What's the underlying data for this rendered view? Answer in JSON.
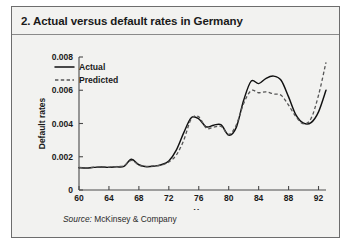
{
  "panel": {
    "title": "2. Actual versus default rates in Germany",
    "source_label": "Source:",
    "source_text": "McKinsey & Company"
  },
  "chart_data": {
    "type": "line",
    "title": "2. Actual versus default rates in Germany",
    "xlabel": "Year",
    "ylabel": "Default rates",
    "xlim": [
      60,
      93
    ],
    "ylim": [
      0,
      0.008
    ],
    "xticks": [
      60,
      64,
      68,
      72,
      76,
      80,
      84,
      88,
      92
    ],
    "yticks": [
      0,
      0.002,
      0.004,
      0.006,
      0.008
    ],
    "ytick_labels": [
      "0",
      "0.002",
      "0.004",
      "0.006",
      "0.008"
    ],
    "grid": false,
    "legend_position": "top-left",
    "legend": [
      "Actual",
      "Predicted"
    ],
    "x": [
      60,
      61,
      62,
      63,
      64,
      65,
      66,
      67,
      68,
      69,
      70,
      71,
      72,
      73,
      74,
      75,
      76,
      77,
      78,
      79,
      80,
      81,
      82,
      83,
      84,
      85,
      86,
      87,
      88,
      89,
      90,
      91,
      92,
      93
    ],
    "series": [
      {
        "name": "Actual",
        "style": "solid",
        "color": "#111111",
        "values": [
          0.00134,
          0.00132,
          0.00136,
          0.00138,
          0.00136,
          0.00139,
          0.00142,
          0.00185,
          0.00152,
          0.0014,
          0.00143,
          0.00152,
          0.00175,
          0.0024,
          0.00345,
          0.00435,
          0.00428,
          0.0038,
          0.0039,
          0.00392,
          0.0033,
          0.00375,
          0.0054,
          0.00655,
          0.0064,
          0.00672,
          0.00685,
          0.0066,
          0.0056,
          0.0045,
          0.00402,
          0.00405,
          0.0047,
          0.006
        ]
      },
      {
        "name": "Predicted",
        "style": "dashed",
        "color": "#555555",
        "values": [
          0.00136,
          0.00134,
          0.00137,
          0.00139,
          0.00138,
          0.00141,
          0.00146,
          0.00178,
          0.0015,
          0.00142,
          0.00145,
          0.0015,
          0.00168,
          0.0021,
          0.003,
          0.00428,
          0.0044,
          0.00372,
          0.00378,
          0.00382,
          0.00335,
          0.0039,
          0.0052,
          0.00598,
          0.00585,
          0.0059,
          0.00578,
          0.0057,
          0.0051,
          0.0044,
          0.00398,
          0.0043,
          0.0057,
          0.00768
        ]
      }
    ]
  }
}
